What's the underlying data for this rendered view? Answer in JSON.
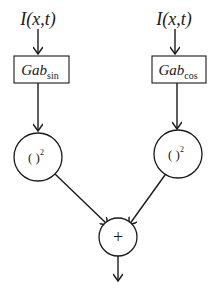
{
  "diagram": {
    "type": "block-diagram",
    "left_branch": {
      "input_label": "I(x,t)",
      "filter_main": "Gab",
      "filter_sub": "sin",
      "square_op": "( )",
      "square_exp": "2"
    },
    "right_branch": {
      "input_label": "I(x,t)",
      "filter_main": "Gab",
      "filter_sub": "cos",
      "square_op": "( )",
      "square_exp": "2"
    },
    "sum_op": "+",
    "colors": {
      "stroke": "#1a1a1a",
      "background": "#ffffff"
    }
  }
}
